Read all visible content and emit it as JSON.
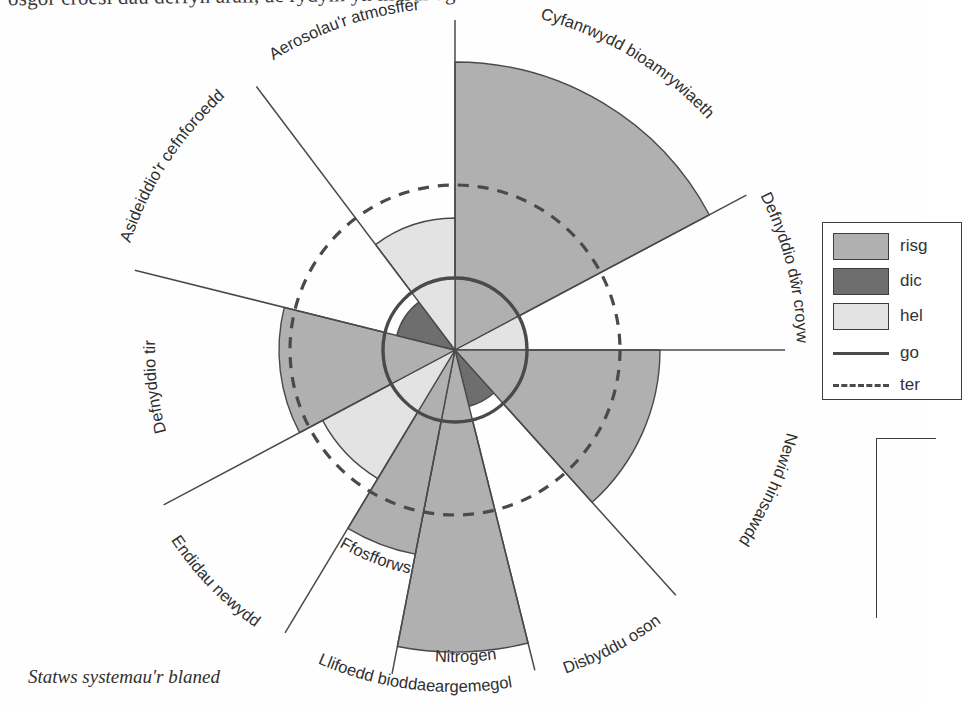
{
  "page": {
    "cut_off_top_line": "osgor croesi  dau derfyn arall, ac rydym yn mesur agos at eraill.",
    "caption": "Statws systemau'r blaned"
  },
  "legend": {
    "rows": [
      {
        "kind": "swatch",
        "color": "#b0b0b0",
        "label": "risg"
      },
      {
        "kind": "swatch",
        "color": "#6e6e6e",
        "label": "dic"
      },
      {
        "kind": "swatch",
        "color": "#e3e3e3",
        "label": "hel"
      },
      {
        "kind": "line-solid",
        "color": "#4a4a4a",
        "label": "go"
      },
      {
        "kind": "line-dashed",
        "color": "#4a4a4a",
        "label": "ter"
      }
    ]
  },
  "chart_data": {
    "type": "pie",
    "title": "Statws systemau'r blaned",
    "xlabel": "",
    "ylabel": "",
    "grid": false,
    "legend_position": "right",
    "center": {
      "x": 455,
      "y": 350
    },
    "rings": {
      "safe_boundary_radius": 72,
      "uncertainty_zone_radius": 165,
      "safe_boundary_style": "solid",
      "uncertainty_zone_style": "dashed"
    },
    "colors": {
      "beyond_uncertainty": "#b0b0b0",
      "high_risk": "#6e6e6e",
      "safe": "#e3e3e3",
      "outline": "#4a4a4a"
    },
    "categories": [
      "Cyfanrwydd bioamrywiaeth",
      "Defnyddio dŵr croyw",
      "Newid hinsawdd",
      "Disbyddu oson",
      "Llifoedd bioddaeargemegol – Nitrogen",
      "Llifoedd bioddaeargemegol – Ffosfforws",
      "Endidau newydd",
      "Defnyddio tir",
      "Asideiddio'r cefnforoedd",
      "Aerosolau'r atmosffer"
    ],
    "sectors": [
      {
        "label": "Cyfanrwydd bioamrywiaeth",
        "start_angle": -90,
        "end_angle": -28,
        "radius": 288,
        "zone": "beyond_uncertainty",
        "label_kind": "two-line-arc"
      },
      {
        "label": "Defnyddio dŵr croyw",
        "start_angle": -28,
        "end_angle": 0,
        "radius": 72,
        "zone": "safe",
        "label_kind": "arc"
      },
      {
        "label": "Newid hinsawdd",
        "start_angle": 0,
        "end_angle": 48,
        "radius": 205,
        "zone": "beyond_uncertainty",
        "label_kind": "arc"
      },
      {
        "label": "Disbyddu oson",
        "start_angle": 48,
        "end_angle": 76,
        "radius": 58,
        "zone": "high_risk",
        "label_kind": "arc"
      },
      {
        "label": "Nitrogen",
        "start_angle": 76,
        "end_angle": 101,
        "radius": 302,
        "zone": "beyond_uncertainty",
        "label_kind": "arc",
        "group": "Llifoedd bioddaeargemegol"
      },
      {
        "label": "Ffosfforws",
        "start_angle": 101,
        "end_angle": 121,
        "radius": 208,
        "zone": "beyond_uncertainty",
        "label_kind": "arc",
        "group": "Llifoedd bioddaeargemegol"
      },
      {
        "label": "Endidau newydd",
        "start_angle": 121,
        "end_angle": 152,
        "radius": 150,
        "zone": "safe",
        "label_kind": "arc"
      },
      {
        "label": "Defnyddio tir",
        "start_angle": 152,
        "end_angle": 194,
        "radius": 176,
        "zone": "beyond_uncertainty",
        "label_kind": "arc"
      },
      {
        "label": "Asideiddio'r cefnforoedd",
        "start_angle": 194,
        "end_angle": 233,
        "radius": 60,
        "zone": "high_risk",
        "label_kind": "arc"
      },
      {
        "label": "Aerosolau'r atmosffer",
        "start_angle": 233,
        "end_angle": 270,
        "radius": 132,
        "zone": "safe",
        "label_kind": "arc"
      }
    ],
    "axis_labels": [
      {
        "text": "Aerosolau'r atmosffer",
        "angle": 251
      },
      {
        "text": "Cyfanrwydd bioamrywiaeth",
        "angle": -59
      },
      {
        "text": "Asideiddio'r cefnforoedd",
        "angle": 213
      },
      {
        "text": "Defnyddio tir",
        "angle": 173
      },
      {
        "text": "Endidau newydd",
        "angle": 136
      },
      {
        "text": "Llifoedd bioddaeargemegol",
        "angle": 97
      },
      {
        "text": "Nitrogen",
        "angle": 88
      },
      {
        "text": "Ffosfforws",
        "angle": 111
      },
      {
        "text": "Disbyddu oson",
        "angle": 62
      },
      {
        "text": "Newid hinsawdd",
        "angle": 24
      },
      {
        "text": "Defnyddio dŵr croyw",
        "angle": -14
      }
    ]
  }
}
